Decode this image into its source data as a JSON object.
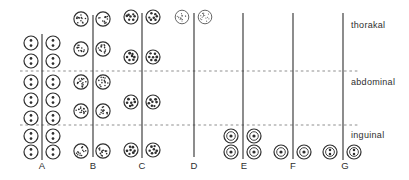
{
  "figure": {
    "type": "diagram",
    "zones": [
      {
        "label": "thorakal",
        "label_x": 351,
        "label_y": 28
      },
      {
        "label": "abdominal",
        "label_x": 351,
        "label_y": 85
      },
      {
        "label": "inguinal",
        "label_x": 351,
        "label_y": 138
      }
    ],
    "zone_boundaries": [
      {
        "y": 71
      },
      {
        "y": 125
      }
    ],
    "dash_x_range": [
      20,
      359
    ],
    "columns": [
      {
        "label": "A",
        "glyph": "circle-two-dots",
        "line_x": 42,
        "line_top": 34,
        "line_bottom": 160,
        "cx_left": 31,
        "cx_right": 53,
        "label_x": 42,
        "rows_y": [
          43,
          61,
          82,
          100,
          118,
          136,
          152
        ],
        "row_zones": [
          "thorakal",
          "thorakal",
          "abdominal",
          "abdominal",
          "abdominal",
          "inguinal",
          "inguinal"
        ]
      },
      {
        "label": "B",
        "glyph": "circle-stipple-medium",
        "line_x": 93,
        "line_top": 15,
        "line_bottom": 157,
        "cx_left": 81,
        "cx_right": 103,
        "label_x": 93,
        "rows_y": [
          19,
          49,
          82,
          111,
          151
        ],
        "row_zones": [
          "thorakal",
          "thorakal",
          "abdominal",
          "abdominal",
          "inguinal"
        ]
      },
      {
        "label": "C",
        "glyph": "circle-large-dots",
        "line_x": 142,
        "line_top": 13,
        "line_bottom": 158,
        "cx_left": 131,
        "cx_right": 153,
        "label_x": 142,
        "rows_y": [
          17,
          57,
          102,
          150
        ],
        "row_zones": [
          "thorakal",
          "thorakal",
          "abdominal",
          "inguinal"
        ]
      },
      {
        "label": "D",
        "glyph": "circle-stipple-fine",
        "line_x": 194,
        "line_top": 13,
        "line_bottom": 157,
        "cx_left": 182,
        "cx_right": 205,
        "label_x": 194,
        "rows_y": [
          17
        ],
        "row_zones": [
          "thorakal"
        ]
      },
      {
        "label": "E",
        "glyph": "ring-one-dot",
        "line_x": 243,
        "line_top": 13,
        "line_bottom": 159,
        "cx_left": 231,
        "cx_right": 254,
        "label_x": 244,
        "rows_y": [
          136,
          152
        ],
        "row_zones": [
          "inguinal",
          "inguinal"
        ]
      },
      {
        "label": "F",
        "glyph": "ring-one-dot",
        "line_x": 293,
        "line_top": 13,
        "line_bottom": 159,
        "cx_left": 281,
        "cx_right": 304,
        "label_x": 293,
        "rows_y": [
          152
        ],
        "row_zones": [
          "inguinal"
        ]
      },
      {
        "label": "G",
        "glyph": "ring-two-dots",
        "line_x": 343,
        "line_top": 13,
        "line_bottom": 160,
        "cx_left": 330,
        "cx_right": 354,
        "label_x": 345,
        "rows_y": [
          152
        ],
        "row_zones": [
          "inguinal"
        ]
      }
    ],
    "colors": {
      "ink": "#2e2e2e",
      "fine": "#5f5f5f",
      "dash": "#8f8f8f",
      "background": "#ffffff"
    }
  }
}
